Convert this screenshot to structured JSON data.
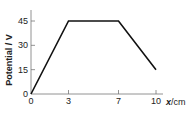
{
  "chart_data": {
    "type": "line",
    "title": "",
    "xlabel": "x / cm",
    "xlabel_var": "x",
    "xlabel_unit": "/cm",
    "ylabel": "Potential / V",
    "x_ticks": [
      0,
      3,
      7,
      10
    ],
    "y_ticks": [
      0,
      15,
      30,
      45
    ],
    "xlim": [
      0,
      13
    ],
    "ylim": [
      0,
      50
    ],
    "grid": false,
    "series": [
      {
        "name": "Potential",
        "x": [
          0,
          3,
          7,
          10
        ],
        "y": [
          0,
          45,
          45,
          15
        ]
      }
    ]
  }
}
